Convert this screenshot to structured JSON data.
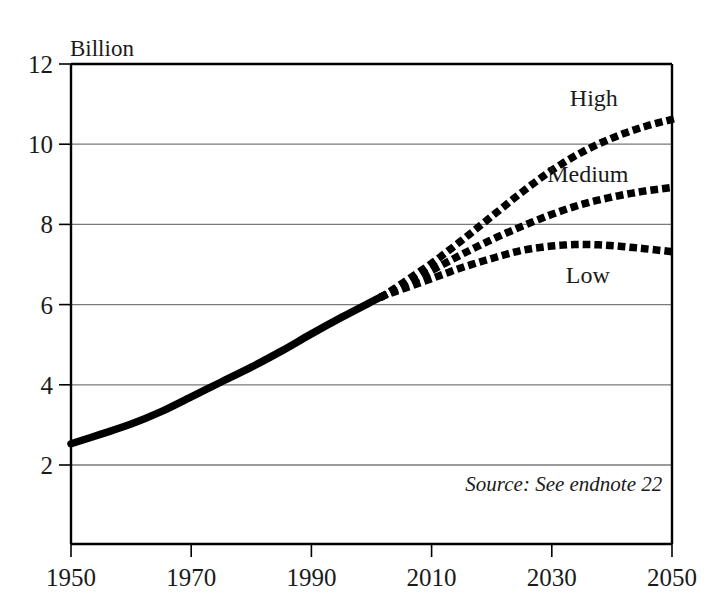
{
  "chart_data": {
    "type": "line",
    "title": "",
    "subtitle": "",
    "xlabel": "",
    "ylabel": "Billion",
    "unit_label": "Billion",
    "xlim": [
      1950,
      2050
    ],
    "ylim": [
      0,
      12
    ],
    "xticks": [
      1950,
      1970,
      1990,
      2010,
      2030,
      2050
    ],
    "xtick_labels": [
      "1950",
      "1970",
      "1990",
      "2010",
      "2030",
      "2050"
    ],
    "yticks": [
      2,
      4,
      6,
      8,
      10,
      12
    ],
    "ytick_labels": [
      "2",
      "4",
      "6",
      "8",
      "10",
      "12"
    ],
    "grid": true,
    "grid_axis": "y",
    "legend": "inline-annotations",
    "line_color": "#000000",
    "grid_color": "#7a7a7a",
    "axis_color": "#000000",
    "annotations": [
      {
        "text": "Source: See endnote 22",
        "x": 2032,
        "y": 1.35,
        "style": "italic"
      }
    ],
    "series": [
      {
        "name": "Historical",
        "style": "solid",
        "label": "",
        "x": [
          1950,
          1955,
          1960,
          1965,
          1970,
          1975,
          1980,
          1985,
          1990,
          1995,
          2000,
          2002
        ],
        "values": [
          2.53,
          2.77,
          3.02,
          3.33,
          3.7,
          4.07,
          4.44,
          4.84,
          5.27,
          5.68,
          6.07,
          6.22
        ]
      },
      {
        "name": "High",
        "style": "dotted",
        "label": "High",
        "label_x": 2037,
        "label_y": 10.95,
        "x": [
          2002,
          2005,
          2010,
          2015,
          2020,
          2025,
          2030,
          2035,
          2040,
          2045,
          2050
        ],
        "values": [
          6.22,
          6.52,
          7.03,
          7.6,
          8.2,
          8.8,
          9.35,
          9.8,
          10.15,
          10.42,
          10.62
        ]
      },
      {
        "name": "Medium",
        "style": "dotted",
        "label": "Medium",
        "label_x": 2036,
        "label_y": 9.05,
        "x": [
          2002,
          2005,
          2010,
          2015,
          2020,
          2025,
          2030,
          2035,
          2040,
          2045,
          2050
        ],
        "values": [
          6.22,
          6.45,
          6.85,
          7.25,
          7.62,
          7.95,
          8.25,
          8.5,
          8.68,
          8.82,
          8.92
        ]
      },
      {
        "name": "Low",
        "style": "dotted",
        "label": "Low",
        "label_x": 2036,
        "label_y": 6.55,
        "x": [
          2002,
          2005,
          2010,
          2015,
          2020,
          2025,
          2030,
          2035,
          2040,
          2045,
          2050
        ],
        "values": [
          6.22,
          6.38,
          6.65,
          6.92,
          7.15,
          7.35,
          7.46,
          7.5,
          7.47,
          7.4,
          7.32
        ]
      }
    ]
  }
}
